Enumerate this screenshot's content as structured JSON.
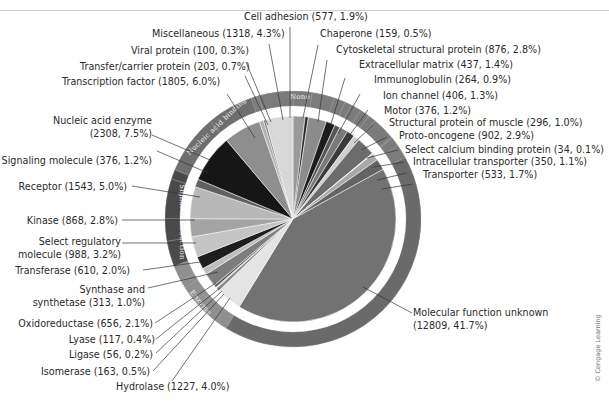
{
  "chart_data": {
    "type": "pie",
    "title": "",
    "total_genes": 30705,
    "start_label": "Cell adhesion",
    "direction": "clockwise",
    "slices": [
      {
        "label": "Cell adhesion",
        "count": 577,
        "percent": 1.9,
        "color": "#9a9a9a",
        "group": "None"
      },
      {
        "label": "Chaperone",
        "count": 159,
        "percent": 0.5,
        "color": "#2b2b2b",
        "group": "None"
      },
      {
        "label": "Cytoskeletal structural protein",
        "count": 876,
        "percent": 2.8,
        "color": "#8c8c8c",
        "group": "None"
      },
      {
        "label": "Extracellular matrix",
        "count": 437,
        "percent": 1.4,
        "color": "#1c1c1c",
        "group": "None"
      },
      {
        "label": "Immunoglobulin",
        "count": 264,
        "percent": 0.9,
        "color": "#555555",
        "group": "None"
      },
      {
        "label": "Ion channel",
        "count": 406,
        "percent": 1.3,
        "color": "#7a7a7a",
        "group": "None"
      },
      {
        "label": "Motor",
        "count": 376,
        "percent": 1.2,
        "color": "#3a3a3a",
        "group": "None"
      },
      {
        "label": "Structural protein of muscle",
        "count": 296,
        "percent": 1.0,
        "color": "#d0d0d0",
        "group": "None"
      },
      {
        "label": "Proto-oncogene",
        "count": 902,
        "percent": 2.9,
        "color": "#6c6c6c",
        "group": "None"
      },
      {
        "label": "Select calcium binding protein",
        "count": 34,
        "percent": 0.1,
        "color": "#e0e0e0",
        "group": "None"
      },
      {
        "label": "Intracellular transporter",
        "count": 350,
        "percent": 1.1,
        "color": "#a8a8a8",
        "group": "None"
      },
      {
        "label": "Transporter",
        "count": 533,
        "percent": 1.7,
        "color": "#646464",
        "group": "None"
      },
      {
        "label": "Molecular function unknown",
        "count": 12809,
        "percent": 41.7,
        "color": "#727272",
        "group": "None"
      },
      {
        "label": "Hydrolase",
        "count": 1227,
        "percent": 4.0,
        "color": "#e4e4e4",
        "group": "Enzyme"
      },
      {
        "label": "Isomerase",
        "count": 163,
        "percent": 0.5,
        "color": "#8a8a8a",
        "group": "Enzyme"
      },
      {
        "label": "Ligase",
        "count": 56,
        "percent": 0.2,
        "color": "#cfcfcf",
        "group": "Enzyme"
      },
      {
        "label": "Lyase",
        "count": 117,
        "percent": 0.4,
        "color": "#5a5a5a",
        "group": "Enzyme"
      },
      {
        "label": "Oxidoreductase",
        "count": 656,
        "percent": 2.1,
        "color": "#7d7d7d",
        "group": "Enzyme"
      },
      {
        "label": "Synthase and synthetase",
        "count": 313,
        "percent": 1.0,
        "color": "#bdbdbd",
        "group": "Enzyme"
      },
      {
        "label": "Transferase",
        "count": 610,
        "percent": 2.0,
        "color": "#1e1e1e",
        "group": "Enzyme"
      },
      {
        "label": "Select regulatory molecule",
        "count": 988,
        "percent": 3.2,
        "color": "#c4c4c4",
        "group": "Signal transduction"
      },
      {
        "label": "Kinase",
        "count": 868,
        "percent": 2.8,
        "color": "#a4a4a4",
        "group": "Signal transduction"
      },
      {
        "label": "Receptor",
        "count": 1543,
        "percent": 5.0,
        "color": "#b8b8b8",
        "group": "Signal transduction"
      },
      {
        "label": "Signaling molecule",
        "count": 376,
        "percent": 1.2,
        "color": "#606060",
        "group": "Signal transduction"
      },
      {
        "label": "Nucleic acid enzyme",
        "count": 2308,
        "percent": 7.5,
        "color": "#161616",
        "group": "Nucleic acid binding"
      },
      {
        "label": "Transcription factor",
        "count": 1805,
        "percent": 6.0,
        "color": "#8e8e8e",
        "group": "Nucleic acid binding"
      },
      {
        "label": "Transfer/carrier protein",
        "count": 203,
        "percent": 0.7,
        "color": "#b2b2b2",
        "group": "None"
      },
      {
        "label": "Viral protein",
        "count": 100,
        "percent": 0.3,
        "color": "#777777",
        "group": "None"
      },
      {
        "label": "Miscellaneous",
        "count": 1318,
        "percent": 4.3,
        "color": "#d8d8d8",
        "group": "None"
      }
    ],
    "outer_ring_labels": [
      "None",
      "Nucleic acid binding",
      "Signal transduction",
      "Enzyme"
    ],
    "credit": "© Cengage Learning"
  },
  "labels": {
    "cell_adhesion": "Cell adhesion (577, 1.9%)",
    "miscellaneous": "Miscellaneous (1318, 4.3%)",
    "chaperone": "Chaperone (159, 0.5%)",
    "viral_protein": "Viral protein (100, 0.3%)",
    "cytoskeletal": "Cytoskeletal structural protein (876, 2.8%)",
    "transfer_carrier": "Transfer/carrier protein (203, 0.7%)",
    "extracellular": "Extracellular matrix (437, 1.4%)",
    "transcription": "Transcription factor (1805, 6.0%)",
    "immunoglobulin": "Immunoglobulin (264, 0.9%)",
    "ion_channel": "Ion channel (406, 1.3%)",
    "motor": "Motor (376, 1.2%)",
    "structural_muscle": "Structural protein of muscle (296, 1.0%)",
    "proto_oncogene": "Proto-oncogene (902, 2.9%)",
    "select_calcium": "Select calcium binding protein (34, 0.1%)",
    "intracellular": "Intracellular transporter (350, 1.1%)",
    "transporter": "Transporter (533, 1.7%)",
    "nucleic_line1": "Nucleic acid enzyme",
    "nucleic_line2": "(2308, 7.5%)",
    "signaling": "Signaling molecule (376, 1.2%)",
    "receptor": "Receptor (1543, 5.0%)",
    "kinase": "Kinase (868, 2.8%)",
    "select_reg_line1": "Select regulatory",
    "select_reg_line2": "molecule (988, 3.2%)",
    "transferase": "Transferase (610, 2.0%)",
    "synthase_line1": "Synthase and",
    "synthase_line2": "synthetase (313, 1.0%)",
    "oxidoreductase": "Oxidoreductase (656, 2.1%)",
    "lyase": "Lyase (117, 0.4%)",
    "ligase": "Ligase (56, 0.2%)",
    "isomerase": "Isomerase (163, 0.5%)",
    "hydrolase": "Hydrolase (1227, 4.0%)",
    "unknown_line1": "Molecular function unknown",
    "unknown_line2": "(12809, 41.7%)",
    "ring_none": "None",
    "ring_nucleic": "Nucleic acid binding",
    "ring_signal": "Signal transduction",
    "ring_enzyme": "Enzyme",
    "credit": "© Cengage Learning"
  }
}
